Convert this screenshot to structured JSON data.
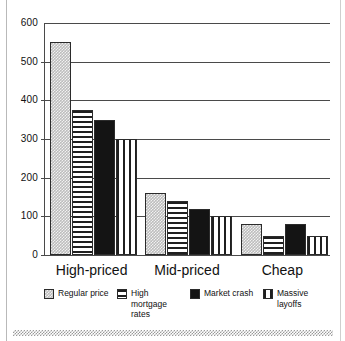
{
  "chart_data": {
    "type": "bar",
    "title": "",
    "xlabel": "",
    "ylabel": "",
    "ylim": [
      0,
      600
    ],
    "yticks": [
      0,
      100,
      200,
      300,
      400,
      500,
      600
    ],
    "ytick_labels": [
      "0",
      "100",
      "200",
      "300",
      "400",
      "500",
      "600"
    ],
    "grid": true,
    "legend_position": "bottom",
    "categories": [
      "High-priced",
      "Mid-priced",
      "Cheap"
    ],
    "series": [
      {
        "name": "Regular price",
        "pattern": "gray-dots",
        "color": "#bdbdbd",
        "values": [
          550,
          160,
          80
        ]
      },
      {
        "name": "High mortgage rates",
        "pattern": "horizontal-lines",
        "color": "#1f1f1f",
        "values": [
          375,
          140,
          50
        ]
      },
      {
        "name": "Market crash",
        "pattern": "solid-black",
        "color": "#141414",
        "values": [
          350,
          120,
          80
        ]
      },
      {
        "name": "Massive layoffs",
        "pattern": "vertical-lines",
        "color": "#1f1f1f",
        "values": [
          300,
          100,
          50
        ]
      }
    ]
  },
  "axis": {
    "y_labels": [
      "600",
      "500",
      "400",
      "300",
      "200",
      "100",
      "0"
    ]
  },
  "categories": {
    "c0": "High-priced",
    "c1": "Mid-priced",
    "c2": "Cheap"
  },
  "legend": {
    "items": [
      {
        "label": "Regular price"
      },
      {
        "label": "High mortgage rates"
      },
      {
        "label": "Market crash"
      },
      {
        "label": "Massive layoffs"
      }
    ]
  }
}
